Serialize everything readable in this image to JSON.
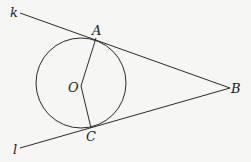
{
  "diagram": {
    "title": "",
    "colors": {
      "stroke": "#2a2a2a",
      "text": "#1a1a1a",
      "background": "#f6f6f5"
    },
    "circle": {
      "center_label": "O",
      "cx": 81,
      "cy": 83,
      "r": 45
    },
    "points": {
      "A": {
        "label": "A",
        "x": 96,
        "y": 38
      },
      "B": {
        "label": "B",
        "x": 230,
        "y": 88
      },
      "C": {
        "label": "C",
        "x": 91,
        "y": 128
      },
      "O": {
        "label": "O",
        "x": 81,
        "y": 86
      }
    },
    "lines": {
      "k": {
        "label": "k",
        "description": "tangent line through A and B"
      },
      "l": {
        "label": "l",
        "description": "tangent line through C and B"
      }
    },
    "segments": [
      "OA",
      "OC"
    ],
    "labels": {
      "k": "k",
      "l": "l",
      "A": "A",
      "B": "B",
      "C": "C",
      "O": "O"
    }
  }
}
